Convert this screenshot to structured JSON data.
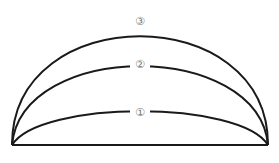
{
  "diagram": {
    "type": "nested-arcs",
    "base": {
      "x1": 12,
      "y1": 145,
      "x2": 268,
      "y2": 145
    },
    "arcs": [
      {
        "id": "arc-1",
        "label": "①",
        "apex_y": 112
      },
      {
        "id": "arc-2",
        "label": "②",
        "apex_y": 64
      },
      {
        "id": "arc-3",
        "label": "③",
        "apex_y": 21
      }
    ],
    "colors": {
      "line": "#1a1a1a",
      "label": "#777777",
      "background": "#ffffff"
    }
  }
}
